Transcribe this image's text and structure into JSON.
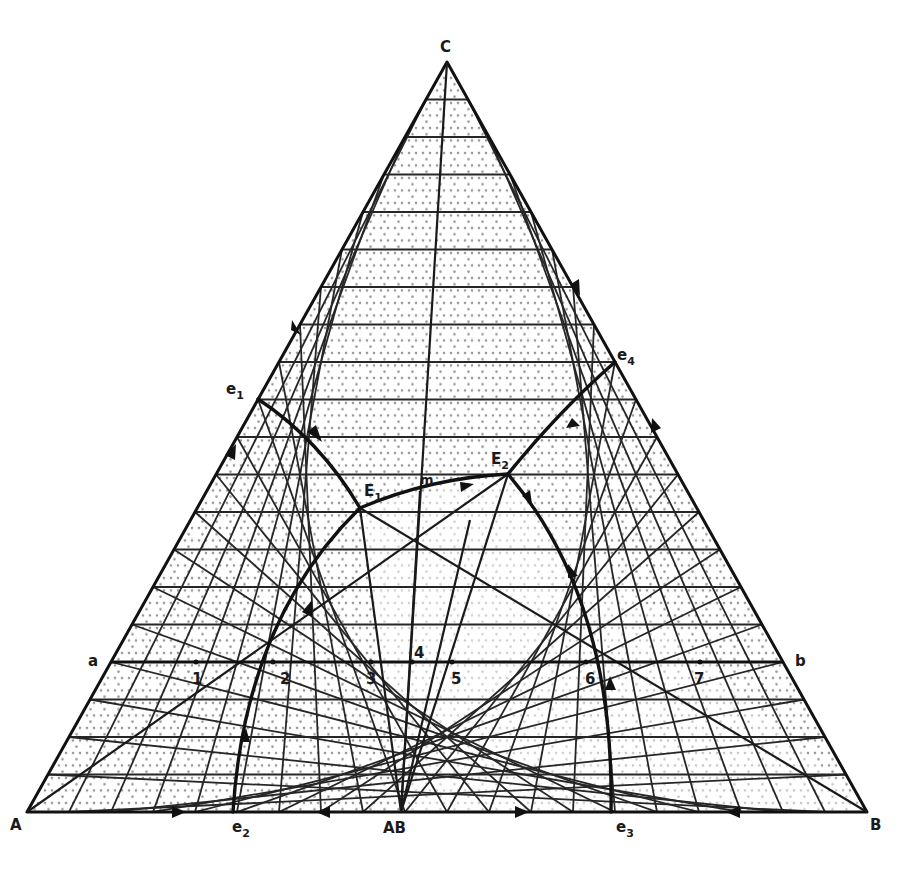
{
  "figure": {
    "type": "ternary phase diagram",
    "grid_divisions": 20,
    "colors": {
      "line": "#111111",
      "grid": "#262626",
      "background": "#ffffff",
      "stipple": "#444444"
    }
  },
  "vertices": {
    "A": {
      "label": "A",
      "x": 27,
      "y": 812
    },
    "B": {
      "label": "B",
      "x": 867,
      "y": 812
    },
    "C": {
      "label": "C",
      "x": 447,
      "y": 62
    },
    "AB": {
      "label": "AB",
      "x": 401,
      "y": 812
    }
  },
  "points": {
    "e1": {
      "label": "e",
      "sub": "1",
      "x": 258,
      "y": 399
    },
    "e2": {
      "label": "e",
      "sub": "2",
      "x": 233,
      "y": 812
    },
    "e3": {
      "label": "e",
      "sub": "3",
      "x": 611,
      "y": 812
    },
    "e4": {
      "label": "e",
      "sub": "4",
      "x": 615,
      "y": 362
    },
    "E1": {
      "label": "E",
      "sub": "1",
      "x": 360,
      "y": 508
    },
    "E2": {
      "label": "E",
      "sub": "2",
      "x": 508,
      "y": 474
    },
    "m": {
      "label": "m",
      "x": 420,
      "y": 491
    }
  },
  "isotherm": {
    "start_label": "a",
    "end_label": "b",
    "y": 662,
    "x_start": 111,
    "x_end": 783,
    "numbered_points": [
      {
        "label": "1",
        "x": 196
      },
      {
        "label": "2",
        "x": 273
      },
      {
        "label": "3",
        "x": 371
      },
      {
        "label": "4",
        "x": 412
      },
      {
        "label": "5",
        "x": 452
      },
      {
        "label": "6",
        "x": 586
      },
      {
        "label": "7",
        "x": 700
      }
    ]
  },
  "labels": {
    "A": "A",
    "B": "B",
    "C": "C",
    "AB": "AB",
    "a": "a",
    "b": "b",
    "m": "m",
    "e": "e",
    "E": "E",
    "n1": "1",
    "n2": "2",
    "n3": "3",
    "n4": "4",
    "n5": "5",
    "n6": "6",
    "n7": "7",
    "s1": "1",
    "s2": "2",
    "s3": "3",
    "s4": "4"
  }
}
